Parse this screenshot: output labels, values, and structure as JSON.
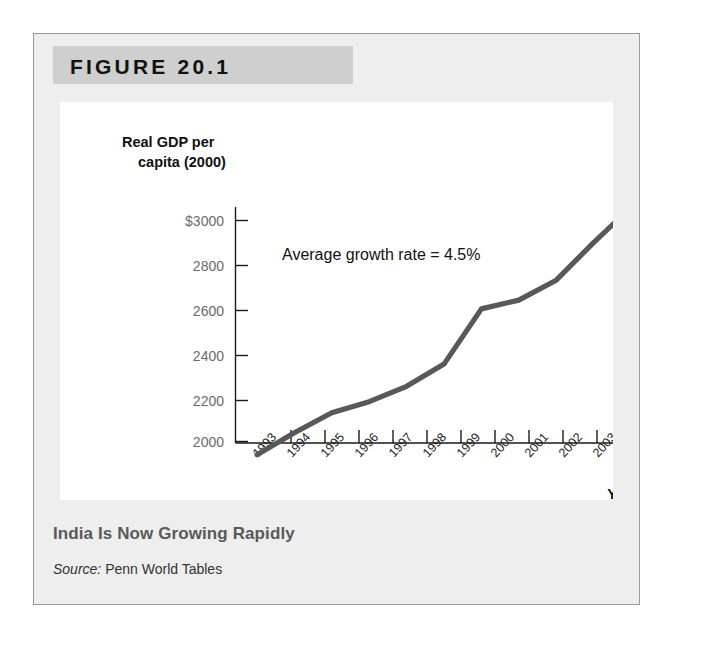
{
  "figure": {
    "header_label": "FIGURE 20.1",
    "caption_title": "India Is Now Growing Rapidly",
    "source_prefix": "Source:",
    "source_text": " Penn World Tables"
  },
  "colors": {
    "line": "#58585a",
    "header_band": "#cfcfcf",
    "panel_background": "#ffffff",
    "figure_background": "#eeeeee",
    "axis": "#1a1a1a",
    "y_tick_label": "#6a6a6a",
    "caption_title": "#595959"
  },
  "chart_data": {
    "type": "line",
    "title": "India Is Now Growing Rapidly",
    "xlabel": "Year",
    "ylabel": "Real GDP per capita (2000)",
    "ylabel_line1": "Real GDP per",
    "ylabel_line2": "capita (2000)",
    "annotation": "Average growth rate = 4.5%",
    "grid": false,
    "legend": "none",
    "xlim": [
      1993,
      2003
    ],
    "ylim": [
      1900,
      3100
    ],
    "ytick_labels": [
      "$3000",
      "2800",
      "2600",
      "2400",
      "2200",
      "2000"
    ],
    "yticks": [
      3000,
      2800,
      2600,
      2400,
      2200,
      2000
    ],
    "categories": [
      "1993",
      "1994",
      "1995",
      "1996",
      "1997",
      "1998",
      "1999",
      "2000",
      "2001",
      "2002",
      "2003"
    ],
    "x": [
      1993,
      1994,
      1995,
      1996,
      1997,
      1998,
      1999,
      2000,
      2001,
      2002,
      2003
    ],
    "values": [
      1940,
      2040,
      2130,
      2180,
      2250,
      2350,
      2600,
      2640,
      2730,
      2900,
      3060
    ],
    "series": [
      {
        "name": "Real GDP per capita (2000)",
        "values": [
          1940,
          2040,
          2130,
          2180,
          2250,
          2350,
          2600,
          2640,
          2730,
          2900,
          3060
        ]
      }
    ]
  }
}
